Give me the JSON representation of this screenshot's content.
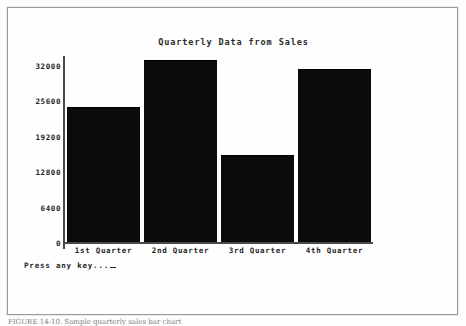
{
  "chart_data": {
    "type": "bar",
    "title": "Quarterly Data from Sales",
    "xlabel": "",
    "ylabel": "",
    "categories": [
      "1st Quarter",
      "2nd Quarter",
      "3rd Quarter",
      "4th Quarter"
    ],
    "values": [
      24200,
      32600,
      15500,
      31000
    ],
    "ylim": [
      0,
      32000
    ],
    "yticks": [
      0,
      6400,
      12800,
      19200,
      25600,
      32000
    ],
    "ytick_labels": [
      "0",
      "6400",
      "12800",
      "19200",
      "25600",
      "32000"
    ],
    "grid": false,
    "legend": null,
    "bar_color": "#0b0b0b",
    "axis_color": "#4a4a4a"
  },
  "screen": {
    "title": "Quarterly Data from Sales",
    "prompt": "Press any key...",
    "cursor": "_"
  },
  "figure": {
    "caption": "FIGURE 14-10. Sample quarterly sales bar chart"
  }
}
